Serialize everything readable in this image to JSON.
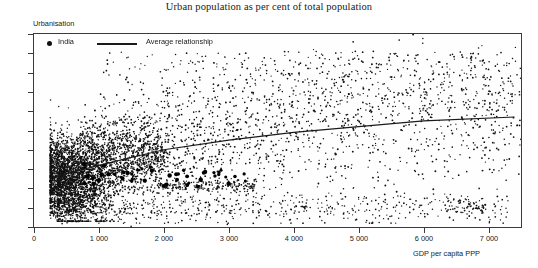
{
  "chart_data": {
    "type": "scatter",
    "title": "Urban population as per cent of total population",
    "xlabel": "GDP per capita PPP",
    "ylabel": "Urbanisation",
    "xlim": [
      0,
      7500
    ],
    "ylim": [
      0,
      100
    ],
    "grid": false,
    "legend_position": "top-left-inside",
    "xticks": [
      0,
      1000,
      2000,
      3000,
      4000,
      5000,
      6000,
      7000
    ],
    "xticklabels": [
      "0",
      "1 000",
      "2 000",
      "3 000",
      "4 000",
      "5 000",
      "6 000",
      "7 000"
    ],
    "yticks": [
      0,
      10,
      20,
      30,
      40,
      50,
      60,
      70,
      80,
      90,
      100
    ],
    "yticklabels": [
      "0",
      "10",
      "20",
      "30",
      "40",
      "50",
      "60",
      "70",
      "80",
      "90",
      "100"
    ],
    "series": [
      {
        "name": "District observations",
        "type": "scatter",
        "marker": "dot",
        "color": "#111111",
        "description": "Dense cloud of small black dots; heaviest concentration at GDP per capita below 1 500 with urbanisation 5-45, fanning upward and rightward; sparse points reach 90 at high GDP and a low band near 5-15 persists across the full GDP range."
      },
      {
        "name": "India",
        "type": "scatter",
        "marker": "large-dot",
        "color": "#000000",
        "description": "Larger bold dots forming a horizontal band at roughly 22-30 per cent urbanisation spanning GDP per capita about 700 to 3 200."
      },
      {
        "name": "Average relationship",
        "type": "line",
        "color": "#1a1a1a",
        "points": [
          [
            300,
            26
          ],
          [
            1000,
            32
          ],
          [
            2000,
            40
          ],
          [
            3000,
            45
          ],
          [
            4000,
            49
          ],
          [
            5000,
            52
          ],
          [
            6000,
            55
          ],
          [
            7400,
            57
          ]
        ],
        "description": "Gently rising concave curve from about 26 per cent at low GDP to about 57 per cent at the right edge."
      }
    ]
  },
  "chart": {
    "title": "Urban population as per cent of total population",
    "y_axis_label": "Urbanisation",
    "x_axis_label": "GDP per capita PPP",
    "legend": {
      "india_label": "India",
      "average_label": "Average relationship"
    },
    "note": ""
  }
}
